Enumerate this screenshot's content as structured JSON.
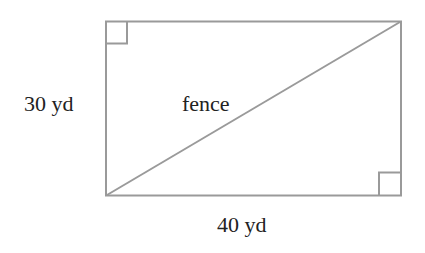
{
  "diagram": {
    "shape": "rectangle",
    "labels": {
      "height": "30 yd",
      "width": "40 yd",
      "diagonal": "fence"
    },
    "right_angle_markers": [
      "top-left",
      "bottom-right"
    ],
    "colors": {
      "stroke": "#9a9a9a",
      "text": "#222222",
      "background": "#ffffff"
    }
  }
}
